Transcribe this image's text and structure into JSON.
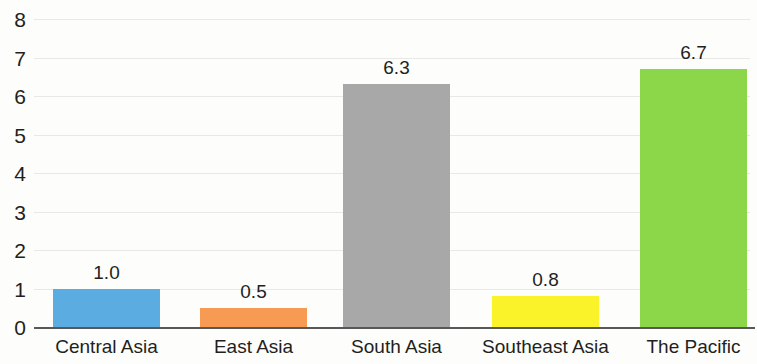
{
  "chart_data": {
    "type": "bar",
    "title": "",
    "subtitle": "",
    "xlabel": "",
    "ylabel": "",
    "categories": [
      "Central Asia",
      "East Asia",
      "South Asia",
      "Southeast Asia",
      "The Pacific"
    ],
    "values": [
      1.0,
      0.5,
      6.3,
      0.8,
      6.7
    ],
    "value_labels": [
      "1.0",
      "0.5",
      "6.3",
      "0.8",
      "6.7"
    ],
    "colors": [
      "#5BACE0",
      "#F79A54",
      "#A8A8A8",
      "#FAF32A",
      "#8CD64A"
    ],
    "ylim": [
      0,
      8
    ],
    "ytick_labels": [
      "0",
      "1",
      "2",
      "3",
      "4",
      "5",
      "6",
      "7",
      "8"
    ],
    "ytick_values": [
      0,
      1,
      2,
      3,
      4,
      5,
      6,
      7,
      8
    ],
    "grid": true,
    "legend": "none",
    "axis_color": "#58585A",
    "gridline_color": "#E8E8E6",
    "background": "#FDFDFC"
  },
  "axis": {
    "ticks": [
      {
        "label": "8",
        "value": 8
      },
      {
        "label": "7",
        "value": 7
      },
      {
        "label": "6",
        "value": 6
      },
      {
        "label": "5",
        "value": 5
      },
      {
        "label": "4",
        "value": 4
      },
      {
        "label": "3",
        "value": 3
      },
      {
        "label": "2",
        "value": 2
      },
      {
        "label": "1",
        "value": 1
      },
      {
        "label": "0",
        "value": 0
      }
    ]
  },
  "bars": [
    {
      "category": "Central Asia",
      "value_label": "1.0",
      "value": 1.0,
      "color": "#5BACE0"
    },
    {
      "category": "East Asia",
      "value_label": "0.5",
      "value": 0.5,
      "color": "#F79A54"
    },
    {
      "category": "South Asia",
      "value_label": "6.3",
      "value": 6.3,
      "color": "#A8A8A8"
    },
    {
      "category": "Southeast Asia",
      "value_label": "0.8",
      "value": 0.8,
      "color": "#FAF32A"
    },
    {
      "category": "The Pacific",
      "value_label": "6.7",
      "value": 6.7,
      "color": "#8CD64A"
    }
  ]
}
